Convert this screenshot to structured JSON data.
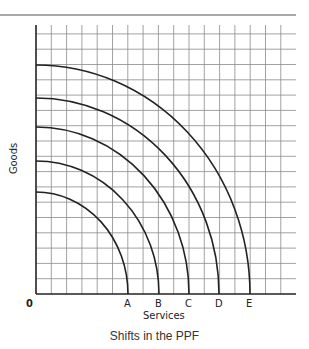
{
  "diagram": {
    "title": "Shifts in the PPF",
    "x_axis_label": "Services",
    "y_axis_label": "Goods",
    "origin_label": "0",
    "curves": [
      {
        "label": "A",
        "x_intercept_px": 128,
        "y_intercept_px": 192
      },
      {
        "label": "B",
        "x_intercept_px": 159,
        "y_intercept_px": 161
      },
      {
        "label": "C",
        "x_intercept_px": 189,
        "y_intercept_px": 127
      },
      {
        "label": "D",
        "x_intercept_px": 219,
        "y_intercept_px": 98
      },
      {
        "label": "E",
        "x_intercept_px": 250,
        "y_intercept_px": 65
      }
    ],
    "colors": {
      "grid": "#888888",
      "axis": "#222222",
      "curve": "#222222"
    }
  }
}
